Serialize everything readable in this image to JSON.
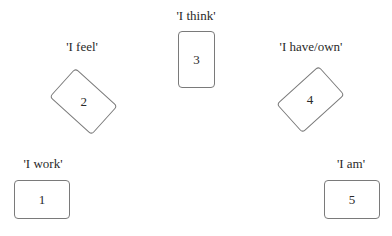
{
  "diagram": {
    "positions": [
      {
        "number": "1",
        "label": "'I work'"
      },
      {
        "number": "2",
        "label": "'I feel'"
      },
      {
        "number": "3",
        "label": "'I think'"
      },
      {
        "number": "4",
        "label": "'I have/own'"
      },
      {
        "number": "5",
        "label": "'I am'"
      }
    ]
  }
}
